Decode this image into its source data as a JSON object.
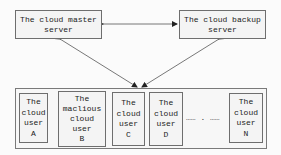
{
  "diagram": {
    "servers": {
      "master": {
        "label": "The cloud master server"
      },
      "backup": {
        "label": "The cloud backup server"
      }
    },
    "connections": [
      {
        "from": "master",
        "to": "backup",
        "type": "bidirectional"
      },
      {
        "from": "master",
        "to": "users",
        "type": "bidirectional"
      },
      {
        "from": "backup",
        "to": "users",
        "type": "bidirectional"
      }
    ],
    "users": [
      {
        "id": "A",
        "label": "The\ncloud\nuser\nA"
      },
      {
        "id": "B",
        "label": "The\nmaclious\ncloud\nuser\nB"
      },
      {
        "id": "C",
        "label": "The\ncloud\nuser\nC"
      },
      {
        "id": "D",
        "label": "The\ncloud\nuser\nD"
      },
      {
        "id": "N",
        "label": "The\ncloud\nuser\nN"
      }
    ],
    "ellipsis": "…… . ……",
    "colors": {
      "border": "#6e6e6e",
      "box_fill": "#f4f4f4",
      "arrow": "#444444"
    }
  }
}
